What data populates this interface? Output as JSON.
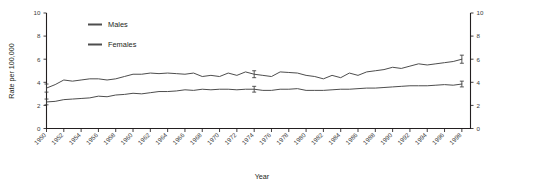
{
  "chart_data": {
    "type": "line",
    "title": "",
    "xlabel": "Year",
    "ylabel": "Rate per 100,000",
    "ylim": [
      0,
      10
    ],
    "xlim": [
      1950,
      1999
    ],
    "ytick_labels": [
      "0",
      "2",
      "4",
      "6",
      "8",
      "10"
    ],
    "ytick_values": [
      0,
      2,
      4,
      6,
      8,
      10
    ],
    "yaxis_right_labels": [
      "0",
      "2",
      "4",
      "6",
      "8",
      "10"
    ],
    "xtick_labels": [
      "1950",
      "1952",
      "1954",
      "1956",
      "1958",
      "1960",
      "1962",
      "1964",
      "1966",
      "1968",
      "1970",
      "1972",
      "1974",
      "1976",
      "1978",
      "1980",
      "1982",
      "1984",
      "1986",
      "1988",
      "1990",
      "1992",
      "1994",
      "1996",
      "1998"
    ],
    "xtick_values": [
      1950,
      1952,
      1954,
      1956,
      1958,
      1960,
      1962,
      1964,
      1966,
      1968,
      1970,
      1972,
      1974,
      1976,
      1978,
      1980,
      1982,
      1984,
      1986,
      1988,
      1990,
      1992,
      1994,
      1996,
      1998
    ],
    "grid": false,
    "legend_position": "top-left",
    "x": [
      1950,
      1951,
      1952,
      1953,
      1954,
      1955,
      1956,
      1957,
      1958,
      1959,
      1960,
      1961,
      1962,
      1963,
      1964,
      1965,
      1966,
      1967,
      1968,
      1969,
      1970,
      1971,
      1972,
      1973,
      1974,
      1975,
      1976,
      1977,
      1978,
      1979,
      1980,
      1981,
      1982,
      1983,
      1984,
      1985,
      1986,
      1987,
      1988,
      1989,
      1990,
      1991,
      1992,
      1993,
      1994,
      1995,
      1996,
      1997,
      1998
    ],
    "series": [
      {
        "name": "Males",
        "color": "#4d4d4d",
        "values": [
          3.5,
          3.8,
          4.2,
          4.1,
          4.2,
          4.3,
          4.3,
          4.2,
          4.3,
          4.5,
          4.7,
          4.7,
          4.8,
          4.75,
          4.8,
          4.75,
          4.7,
          4.8,
          4.5,
          4.6,
          4.5,
          4.8,
          4.6,
          4.9,
          4.7,
          4.6,
          4.5,
          4.9,
          4.85,
          4.8,
          4.6,
          4.5,
          4.3,
          4.6,
          4.4,
          4.8,
          4.6,
          4.9,
          5.0,
          5.1,
          5.3,
          5.2,
          5.4,
          5.6,
          5.5,
          5.6,
          5.7,
          5.8,
          6.0
        ],
        "error_bars": [
          {
            "x": 1950,
            "value": 3.5,
            "low": 3.15,
            "high": 3.85
          },
          {
            "x": 1974,
            "value": 4.7,
            "low": 4.4,
            "high": 5.0
          },
          {
            "x": 1998,
            "value": 6.0,
            "low": 5.65,
            "high": 6.35
          }
        ]
      },
      {
        "name": "Females",
        "color": "#4d4d4d",
        "values": [
          2.3,
          2.35,
          2.5,
          2.55,
          2.6,
          2.65,
          2.8,
          2.75,
          2.9,
          2.95,
          3.05,
          3.0,
          3.1,
          3.2,
          3.2,
          3.25,
          3.35,
          3.3,
          3.4,
          3.35,
          3.4,
          3.4,
          3.35,
          3.4,
          3.4,
          3.3,
          3.3,
          3.4,
          3.4,
          3.45,
          3.3,
          3.3,
          3.3,
          3.35,
          3.4,
          3.4,
          3.45,
          3.5,
          3.5,
          3.55,
          3.6,
          3.65,
          3.7,
          3.7,
          3.7,
          3.75,
          3.8,
          3.75,
          3.85
        ],
        "error_bars": [
          {
            "x": 1950,
            "value": 2.3,
            "low": 2.05,
            "high": 2.55
          },
          {
            "x": 1974,
            "value": 3.4,
            "low": 3.15,
            "high": 3.65
          },
          {
            "x": 1998,
            "value": 3.85,
            "low": 3.6,
            "high": 4.1
          }
        ]
      }
    ]
  },
  "legend": {
    "items": [
      {
        "label": "Males"
      },
      {
        "label": "Females"
      }
    ]
  }
}
